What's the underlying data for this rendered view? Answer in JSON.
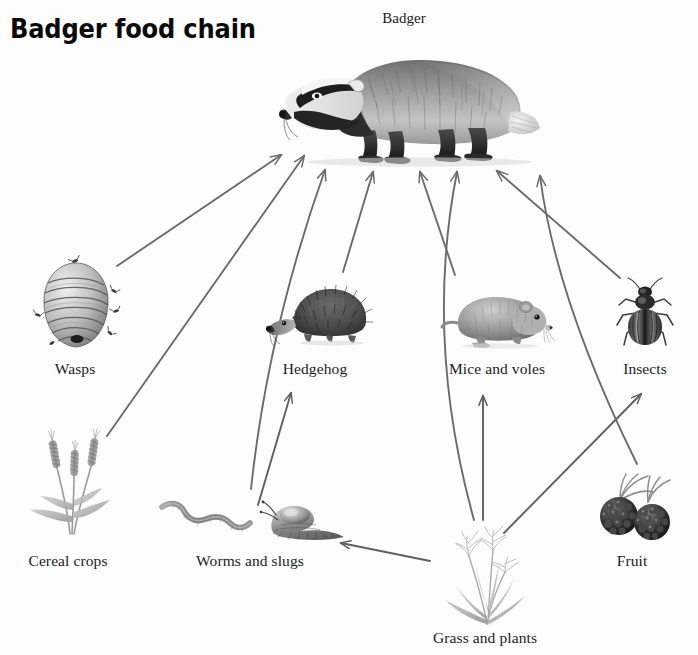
{
  "title": "Badger food chain",
  "badger_caption": "Badger",
  "colors": {
    "arrow": "#6b6b6b",
    "ink": "#1b1b1b",
    "background": "#ffffff",
    "sketch_dark": "#3a3a3a",
    "sketch_mid": "#8d8d8d",
    "sketch_light": "#c9c9c9"
  },
  "diagram": {
    "type": "food-chain-diagram",
    "apex": {
      "id": "badger",
      "label": "Badger",
      "x": 404,
      "y": 100
    },
    "nodes": [
      {
        "id": "wasps",
        "label": "Wasps",
        "x": 75,
        "y": 305,
        "label_y": 368
      },
      {
        "id": "hedgehog",
        "label": "Hedgehog",
        "x": 315,
        "y": 310,
        "label_y": 368
      },
      {
        "id": "mice",
        "label": "Mice and voles",
        "x": 497,
        "y": 315,
        "label_y": 368
      },
      {
        "id": "insects",
        "label": "Insects",
        "x": 645,
        "y": 310,
        "label_y": 368
      },
      {
        "id": "cereal",
        "label": "Cereal crops",
        "x": 68,
        "y": 485,
        "label_y": 560
      },
      {
        "id": "worms",
        "label": "Worms and slugs",
        "x": 250,
        "y": 515,
        "label_y": 560
      },
      {
        "id": "fruit",
        "label": "Fruit",
        "x": 632,
        "y": 510,
        "label_y": 560
      },
      {
        "id": "grass",
        "label": "Grass and plants",
        "x": 485,
        "y": 580,
        "label_y": 637
      }
    ],
    "edges": [
      {
        "from": "wasps",
        "to": "badger"
      },
      {
        "from": "cereal",
        "to": "badger"
      },
      {
        "from": "worms",
        "to": "badger"
      },
      {
        "from": "hedgehog",
        "to": "badger"
      },
      {
        "from": "mice",
        "to": "badger"
      },
      {
        "from": "grass",
        "to": "badger"
      },
      {
        "from": "insects",
        "to": "badger"
      },
      {
        "from": "fruit",
        "to": "badger"
      },
      {
        "from": "worms",
        "to": "hedgehog"
      },
      {
        "from": "grass",
        "to": "worms"
      },
      {
        "from": "grass",
        "to": "mice"
      },
      {
        "from": "grass",
        "to": "insects"
      }
    ]
  },
  "icons": {
    "badger": "badger-illustration",
    "wasps": "wasp-nest-illustration",
    "hedgehog": "hedgehog-illustration",
    "mice": "vole-illustration",
    "insects": "beetle-illustration",
    "cereal": "wheat-illustration",
    "worms": "worm-and-slug-illustration",
    "fruit": "blackberries-illustration",
    "grass": "grass-illustration"
  }
}
